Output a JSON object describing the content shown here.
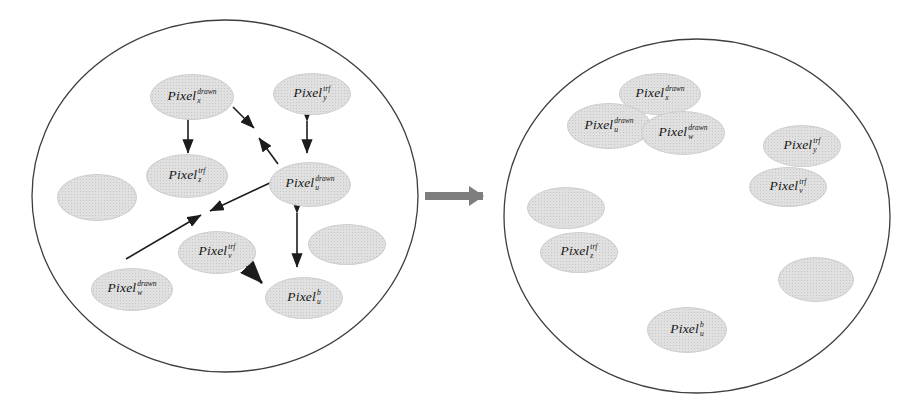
{
  "figure": {
    "description_hidden": false,
    "colors": {
      "background": "#ffffff",
      "node_fill": "#e0e0e0",
      "node_stipple": "#c6c6c6",
      "node_text": "#151515",
      "circle_stroke": "#3e3e3e",
      "arrow_color": "#1c1c1c",
      "transition_arrow_color": "#7e7e7e"
    },
    "left_circle": {
      "cx": 225,
      "cy": 196,
      "rx": 193,
      "ry": 176,
      "nodes": [
        {
          "name": "node-pixel-x-drawn",
          "base": "Pixel",
          "sub": "x",
          "sup": "drawn",
          "cx": 192,
          "cy": 97,
          "w": 84,
          "h": 46
        },
        {
          "name": "node-pixel-y-trf",
          "base": "Pixel",
          "sub": "y",
          "sup": "trf",
          "cx": 312,
          "cy": 94,
          "w": 78,
          "h": 42
        },
        {
          "name": "node-pixel-z-trf",
          "base": "Pixel",
          "sub": "z",
          "sup": "trf",
          "cx": 187,
          "cy": 176,
          "w": 82,
          "h": 44
        },
        {
          "name": "node-pixel-u-drawn",
          "base": "Pixel",
          "sub": "u",
          "sup": "drawn",
          "cx": 310,
          "cy": 184,
          "w": 82,
          "h": 45
        },
        {
          "name": "node-blank",
          "base": "",
          "sub": "",
          "sup": "",
          "cx": 97,
          "cy": 197,
          "w": 80,
          "h": 47
        },
        {
          "name": "node-pixel-v-trf",
          "base": "Pixel",
          "sub": "v",
          "sup": "trf",
          "cx": 217,
          "cy": 252,
          "w": 78,
          "h": 43
        },
        {
          "name": "node-pixel-w-drawn",
          "base": "Pixel",
          "sub": "w",
          "sup": "drawn",
          "cx": 132,
          "cy": 289,
          "w": 82,
          "h": 43
        },
        {
          "name": "node-pixel-u-b",
          "base": "Pixel",
          "sub": "u",
          "sup": "b",
          "cx": 304,
          "cy": 298,
          "w": 78,
          "h": 42
        },
        {
          "name": "node-blank",
          "base": "",
          "sub": "",
          "sup": "",
          "cx": 347,
          "cy": 244,
          "w": 78,
          "h": 41
        }
      ],
      "arrows": [
        {
          "x1": 188,
          "y1": 120,
          "x2": 188,
          "y2": 153,
          "double": true,
          "w": 1.6
        },
        {
          "x1": 233,
          "y1": 107,
          "x2": 254,
          "y2": 128,
          "double": false,
          "w": 1.6
        },
        {
          "x1": 278,
          "y1": 164,
          "x2": 259,
          "y2": 138,
          "double": false,
          "w": 1.6
        },
        {
          "x1": 307,
          "y1": 121,
          "x2": 307,
          "y2": 153,
          "double": true,
          "w": 1.6
        },
        {
          "x1": 274,
          "y1": 181,
          "x2": 210,
          "y2": 211,
          "double": false,
          "w": 1.6
        },
        {
          "x1": 126,
          "y1": 259,
          "x2": 201,
          "y2": 215,
          "double": false,
          "w": 1.6
        },
        {
          "x1": 297,
          "y1": 213,
          "x2": 297,
          "y2": 267,
          "double": true,
          "w": 1.6
        },
        {
          "x1": 247,
          "y1": 267,
          "x2": 262,
          "y2": 283,
          "double": true,
          "w": 2.6
        }
      ]
    },
    "right_circle": {
      "cx": 697,
      "cy": 216,
      "rx": 193,
      "ry": 177,
      "nodes": [
        {
          "name": "node-pixel-x-drawn",
          "base": "Pixel",
          "sub": "x",
          "sup": "drawn",
          "cx": 660,
          "cy": 94,
          "w": 82,
          "h": 42
        },
        {
          "name": "node-pixel-u-drawn",
          "base": "Pixel",
          "sub": "u",
          "sup": "drawn",
          "cx": 609,
          "cy": 126,
          "w": 84,
          "h": 46
        },
        {
          "name": "node-pixel-w-drawn",
          "base": "Pixel",
          "sub": "w",
          "sup": "drawn",
          "cx": 683,
          "cy": 133,
          "w": 84,
          "h": 44
        },
        {
          "name": "node-pixel-y-trf",
          "base": "Pixel",
          "sub": "y",
          "sup": "trf",
          "cx": 802,
          "cy": 146,
          "w": 78,
          "h": 42
        },
        {
          "name": "node-pixel-v-trf",
          "base": "Pixel",
          "sub": "v",
          "sup": "trf",
          "cx": 788,
          "cy": 187,
          "w": 78,
          "h": 40
        },
        {
          "name": "node-blank",
          "base": "",
          "sub": "",
          "sup": "",
          "cx": 566,
          "cy": 208,
          "w": 78,
          "h": 42
        },
        {
          "name": "node-pixel-z-trf",
          "base": "Pixel",
          "sub": "z",
          "sup": "trf",
          "cx": 579,
          "cy": 252,
          "w": 78,
          "h": 41
        },
        {
          "name": "node-blank",
          "base": "",
          "sub": "",
          "sup": "",
          "cx": 816,
          "cy": 279,
          "w": 76,
          "h": 45
        },
        {
          "name": "node-pixel-u-b",
          "base": "Pixel",
          "sub": "u",
          "sup": "b",
          "cx": 687,
          "cy": 330,
          "w": 80,
          "h": 46
        }
      ],
      "arrows": []
    },
    "transition_arrow": {
      "x1": 425,
      "y1": 196,
      "x2": 483,
      "y2": 196,
      "shaft_width": 8
    }
  }
}
